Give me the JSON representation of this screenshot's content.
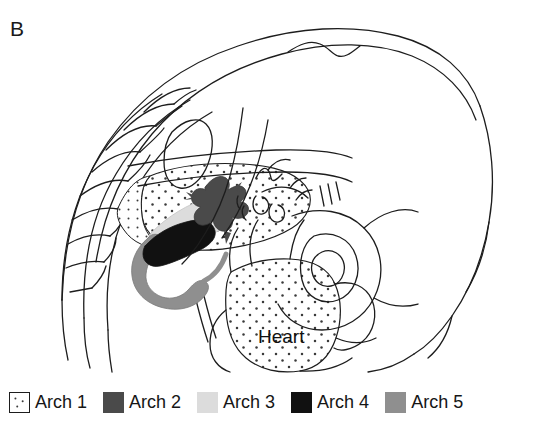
{
  "figure": {
    "panel_label": "B",
    "type": "anatomical-line-drawing",
    "background_color": "#ffffff",
    "line_color": "#1d1d1d"
  },
  "drawing": {
    "labels": [
      {
        "name": "heart-label",
        "text": "Heart",
        "x": 258,
        "y": 343,
        "font_size": 19
      }
    ],
    "regions": [
      {
        "name": "heart-region",
        "arch": "Arch 1",
        "fill": "stipple",
        "description": "large stippled heart bulge, lower centre"
      },
      {
        "name": "arch1-mandibular-region",
        "arch": "Arch 1",
        "fill": "stipple",
        "description": "stippled pharyngeal tissue band"
      },
      {
        "name": "arch2-vessel",
        "arch": "Arch 2",
        "fill": "#4a4a4a",
        "description": "dark-grey branching vessel, centre"
      },
      {
        "name": "arch3-vessel",
        "arch": "Arch 3",
        "fill": "#dcdcdc",
        "description": "pale-grey arch band running diagonally"
      },
      {
        "name": "arch4-vessel",
        "arch": "Arch 4",
        "fill": "#111111",
        "description": "black arch band, left of centre"
      },
      {
        "name": "arch5-vessel",
        "arch": "Arch 5",
        "fill": "#8f8f8f",
        "description": "medium-grey C-shaped loop, lower left of centre"
      }
    ]
  },
  "legend": {
    "name": "arch-legend",
    "items": [
      {
        "swatch": "arch1-swatch",
        "style": "outline-stipple",
        "color": "#ffffff",
        "border": "#1d1d1d",
        "label": "Arch 1"
      },
      {
        "swatch": "arch2-swatch",
        "style": "solid",
        "color": "#4a4a4a",
        "border": "#4a4a4a",
        "label": "Arch 2"
      },
      {
        "swatch": "arch3-swatch",
        "style": "solid",
        "color": "#dcdcdc",
        "border": "#dcdcdc",
        "label": "Arch 3"
      },
      {
        "swatch": "arch4-swatch",
        "style": "solid",
        "color": "#111111",
        "border": "#111111",
        "label": "Arch 4"
      },
      {
        "swatch": "arch5-swatch",
        "style": "solid",
        "color": "#8f8f8f",
        "border": "#8f8f8f",
        "label": "Arch 5"
      }
    ]
  }
}
